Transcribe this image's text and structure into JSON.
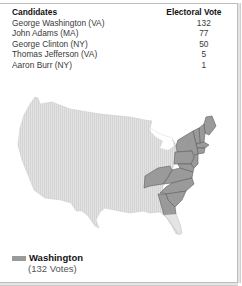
{
  "table": {
    "headers": {
      "candidates": "Candidates",
      "votes": "Electoral Vote"
    },
    "rows": [
      {
        "name": "George Washington (VA)",
        "votes": "132"
      },
      {
        "name": "John Adams (MA)",
        "votes": "77"
      },
      {
        "name": "George Clinton (NY)",
        "votes": "50"
      },
      {
        "name": "Thomas Jefferson (VA)",
        "votes": "5"
      },
      {
        "name": "Aaron Burr (NY)",
        "votes": "1"
      }
    ]
  },
  "map": {
    "region": "United States",
    "base_color": "#dcdcdc",
    "highlight_color": "#9a9a9a",
    "highlighted_states_label": "States won by Washington"
  },
  "legend": {
    "label": "Washington",
    "sub_label": "(132 Votes)",
    "color": "#9a9a9a"
  }
}
